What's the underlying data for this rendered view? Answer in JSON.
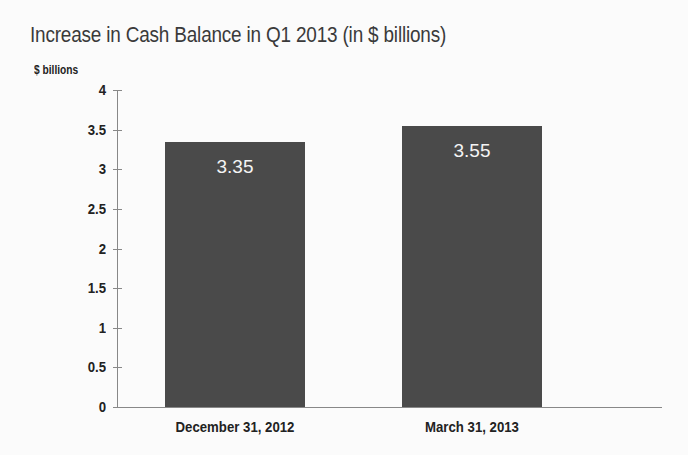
{
  "chart_data": {
    "type": "bar",
    "title": "Increase in Cash Balance in Q1 2013 (in $ billions)",
    "ylabel": "$ billions",
    "xlabel": "",
    "categories": [
      "December 31, 2012",
      "March 31, 2013"
    ],
    "values": [
      3.35,
      3.55
    ],
    "data_labels": [
      "3.35",
      "3.55"
    ],
    "ylim": [
      0,
      4
    ],
    "yticks": [
      "0",
      "0.5",
      "1",
      "1.5",
      "2",
      "2.5",
      "3",
      "3.5",
      "4"
    ],
    "grid": false,
    "legend": null,
    "bar_color": "#4a4a4a"
  }
}
